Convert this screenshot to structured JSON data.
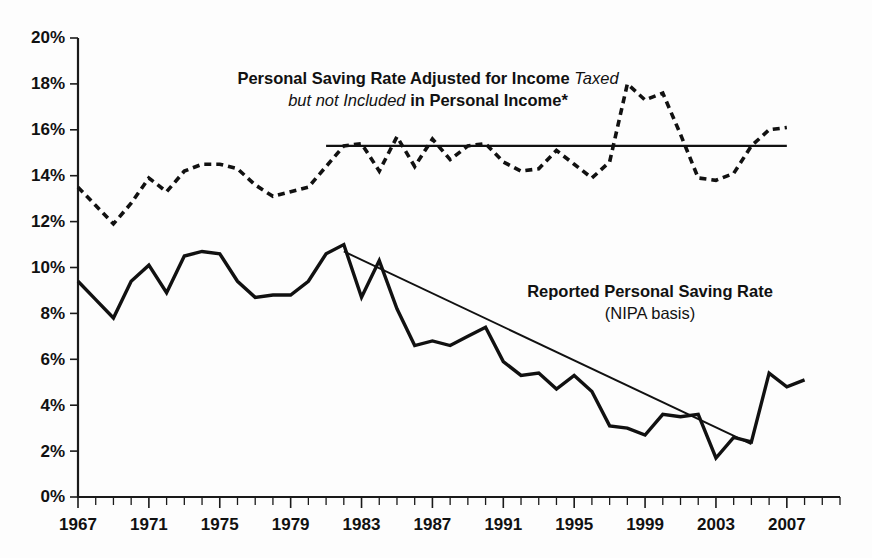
{
  "chart_data": {
    "type": "line",
    "title": "",
    "xlabel": "",
    "ylabel": "",
    "xlim": [
      1967,
      2010
    ],
    "ylim": [
      0,
      20
    ],
    "grid": false,
    "legend_position": "inline-annotations",
    "x": [
      1967,
      1968,
      1969,
      1970,
      1971,
      1972,
      1973,
      1974,
      1975,
      1976,
      1977,
      1978,
      1979,
      1980,
      1981,
      1982,
      1983,
      1984,
      1985,
      1986,
      1987,
      1988,
      1989,
      1990,
      1991,
      1992,
      1993,
      1994,
      1995,
      1996,
      1997,
      1998,
      1999,
      2000,
      2001,
      2002,
      2003,
      2004,
      2005,
      2006,
      2007,
      2008,
      2009,
      2010
    ],
    "series": [
      {
        "name": "Personal Saving Rate Adjusted for Income Taxed but not Included in Personal Income*",
        "style": "dashed",
        "values": [
          13.5,
          12.7,
          11.9,
          12.8,
          13.9,
          13.3,
          14.2,
          14.5,
          14.5,
          14.3,
          13.6,
          13.1,
          13.3,
          13.5,
          14.4,
          15.3,
          15.4,
          14.2,
          15.7,
          14.4,
          15.6,
          14.7,
          15.3,
          15.4,
          14.6,
          14.2,
          14.3,
          15.1,
          14.5,
          13.9,
          14.6,
          18.0,
          17.3,
          17.6,
          15.8,
          13.9,
          13.8,
          14.1,
          15.3,
          16.0,
          16.1,
          null,
          null,
          null
        ]
      },
      {
        "name": "Reported Personal Saving Rate (NIPA basis)",
        "style": "solid",
        "values": [
          9.4,
          8.6,
          7.8,
          9.4,
          10.1,
          8.9,
          10.5,
          10.7,
          10.6,
          9.4,
          8.7,
          8.8,
          8.8,
          9.4,
          10.6,
          11.0,
          8.7,
          10.3,
          8.2,
          6.6,
          6.8,
          6.6,
          7.0,
          7.4,
          5.9,
          5.3,
          5.4,
          4.7,
          5.3,
          4.6,
          3.1,
          3.0,
          2.7,
          3.6,
          3.5,
          3.6,
          1.7,
          2.6,
          2.4,
          5.4,
          4.8,
          5.1,
          null,
          null
        ]
      }
    ],
    "reference_lines": [
      {
        "name": "horizontal-reference",
        "orientation": "horizontal",
        "value": 15.3,
        "x_start": 1981,
        "x_end": 2007
      },
      {
        "name": "declining-trend",
        "orientation": "sloped",
        "x_start": 1982,
        "y_start": 10.7,
        "x_end": 2005,
        "y_end": 2.3
      }
    ],
    "y_ticks": [
      "0%",
      "2%",
      "4%",
      "6%",
      "8%",
      "10%",
      "12%",
      "14%",
      "16%",
      "18%",
      "20%"
    ],
    "y_tick_values": [
      0,
      2,
      4,
      6,
      8,
      10,
      12,
      14,
      16,
      18,
      20
    ],
    "x_ticks": [
      "1967",
      "1971",
      "1975",
      "1979",
      "1983",
      "1987",
      "1991",
      "1995",
      "1999",
      "2003",
      "2007"
    ],
    "x_tick_values": [
      1967,
      1971,
      1975,
      1979,
      1983,
      1987,
      1991,
      1995,
      1999,
      2003,
      2007
    ]
  },
  "annotations": {
    "adjusted": {
      "line1_bold": "Personal Saving Rate Adjusted for Income",
      "line1_italic": "Taxed",
      "line2_italic": "but not Included",
      "line2_bold": "in Personal Income*"
    },
    "reported": {
      "line1": "Reported Personal Saving Rate",
      "line2": "(NIPA basis)"
    }
  },
  "colors": {
    "ink": "#111111",
    "background": "#fdfdfd"
  }
}
